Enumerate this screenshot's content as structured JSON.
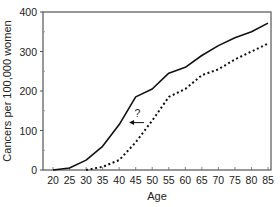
{
  "chart_data": {
    "type": "line",
    "title": "",
    "xlabel": "Age",
    "ylabel": "Cancers per 100,000 women",
    "xlim": [
      20,
      85
    ],
    "ylim": [
      0,
      400
    ],
    "x_ticks": [
      20,
      25,
      30,
      35,
      40,
      45,
      50,
      55,
      60,
      65,
      70,
      75,
      80,
      85
    ],
    "y_ticks": [
      0,
      100,
      200,
      300,
      400
    ],
    "grid": false,
    "legend": null,
    "x": [
      20,
      25,
      30,
      35,
      40,
      45,
      50,
      55,
      60,
      65,
      70,
      75,
      80,
      85
    ],
    "series": [
      {
        "name": "solid",
        "style": "solid",
        "values": [
          0,
          5,
          25,
          60,
          115,
          185,
          205,
          245,
          260,
          290,
          315,
          335,
          350,
          372
        ]
      },
      {
        "name": "dotted",
        "style": "dotted",
        "values": [
          null,
          null,
          0,
          8,
          25,
          70,
          125,
          185,
          205,
          240,
          255,
          280,
          300,
          320
        ]
      }
    ],
    "annotations": [
      {
        "text": "?",
        "type": "arrow",
        "direction": "left",
        "x_from": 47.5,
        "x_to": 43,
        "y": 120
      }
    ]
  },
  "labels": {
    "xlabel": "Age",
    "ylabel": "Cancers per 100,000 women",
    "annotation": "?"
  }
}
